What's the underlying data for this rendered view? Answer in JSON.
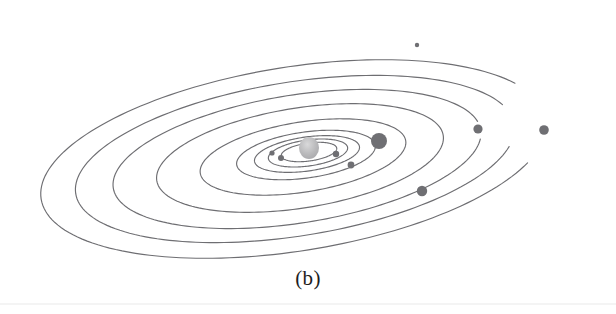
{
  "figure": {
    "caption": "(b)",
    "kind": "solar-system-diagram",
    "background_color": "#ffffff",
    "orbit_stroke_color": "#6e6e72",
    "orbit_stroke_width": 1.15,
    "planet_color": "#6f6f73",
    "sun_color": "#b9b9bb",
    "sun_highlight_color": "#d9d9da",
    "caption_color": "#1d1d1d"
  },
  "chart_data": {
    "type": "scatter",
    "title": "(b)",
    "xlabel": "",
    "ylabel": "",
    "projection": "tilted perspective, orbits drawn as open elliptical arcs",
    "center": {
      "cx": 309,
      "cy": 152,
      "label": "Sun"
    },
    "orbits": [
      {
        "name": "orbit-1",
        "rx": 28,
        "ry": 9,
        "rotation": -8,
        "cx": 309,
        "cy": 152,
        "start_deg": 0,
        "end_deg": 360
      },
      {
        "name": "orbit-2",
        "rx": 40,
        "ry": 13,
        "rotation": -8,
        "cx": 308,
        "cy": 153,
        "start_deg": 0,
        "end_deg": 360
      },
      {
        "name": "orbit-3",
        "rx": 53,
        "ry": 17,
        "rotation": -8,
        "cx": 307,
        "cy": 154,
        "start_deg": 0,
        "end_deg": 360
      },
      {
        "name": "orbit-4",
        "rx": 70,
        "ry": 23,
        "rotation": -8,
        "cx": 306,
        "cy": 155,
        "start_deg": 0,
        "end_deg": 360
      },
      {
        "name": "orbit-5",
        "rx": 104,
        "ry": 35,
        "rotation": -9,
        "cx": 303,
        "cy": 157,
        "start_deg": 0,
        "end_deg": 360
      },
      {
        "name": "orbit-6",
        "rx": 145,
        "ry": 50,
        "rotation": -9,
        "cx": 300,
        "cy": 158,
        "start_deg": 0,
        "end_deg": 360
      },
      {
        "name": "orbit-7",
        "rx": 186,
        "ry": 64,
        "rotation": -9,
        "cx": 297,
        "cy": 159,
        "start_deg": 8,
        "end_deg": 352
      },
      {
        "name": "orbit-8",
        "rx": 222,
        "ry": 77,
        "rotation": -9,
        "cx": 295,
        "cy": 159,
        "start_deg": 16,
        "end_deg": 344
      },
      {
        "name": "orbit-9",
        "rx": 256,
        "ry": 92,
        "rotation": -9,
        "cx": 294,
        "cy": 159,
        "start_deg": 26,
        "end_deg": 334
      }
    ],
    "planets": [
      {
        "name": "inner-planet-left",
        "x": 281,
        "y": 158,
        "r": 3.0
      },
      {
        "name": "inner-planet-right",
        "x": 336,
        "y": 154,
        "r": 3.2
      },
      {
        "name": "inner-planet-lower",
        "x": 351,
        "y": 165,
        "r": 3.4
      },
      {
        "name": "inner-planet-mid",
        "x": 272,
        "y": 153,
        "r": 2.6
      },
      {
        "name": "gas-giant-large",
        "x": 379,
        "y": 141,
        "r": 8.0
      },
      {
        "name": "planet-lower-right",
        "x": 422,
        "y": 191,
        "r": 5.2
      },
      {
        "name": "planet-outer-mid",
        "x": 478,
        "y": 129,
        "r": 4.6
      },
      {
        "name": "planet-outer-far",
        "x": 544,
        "y": 130,
        "r": 4.8
      },
      {
        "name": "planet-outermost-top",
        "x": 417,
        "y": 45,
        "r": 2.2
      }
    ],
    "grid": false,
    "legend": null
  }
}
